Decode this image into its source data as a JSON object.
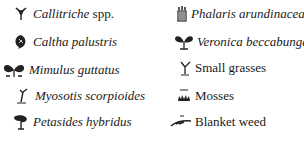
{
  "legend": {
    "left": [
      {
        "icon": "callitriche-icon",
        "label": "Callitriche spp.",
        "italic_part": "Callitriche",
        "roman_part": " spp."
      },
      {
        "icon": "caltha-leaf-icon",
        "label": "Caltha palustris"
      },
      {
        "icon": "mimulus-icon",
        "label": "Mimulus guttatus"
      },
      {
        "icon": "myosotis-icon",
        "label": "Myosotis scorpioides"
      },
      {
        "icon": "petasides-icon",
        "label": "Petasides hybridus"
      }
    ],
    "right": [
      {
        "icon": "phalaris-icon",
        "label": "Phalaris arundinacea"
      },
      {
        "icon": "veronica-icon",
        "label": "Veronica beccabunga"
      },
      {
        "icon": "small-grasses-icon",
        "label": "Small grasses"
      },
      {
        "icon": "mosses-icon",
        "label": "Mosses"
      },
      {
        "icon": "blanket-weed-icon",
        "label": "Blanket weed"
      }
    ]
  }
}
